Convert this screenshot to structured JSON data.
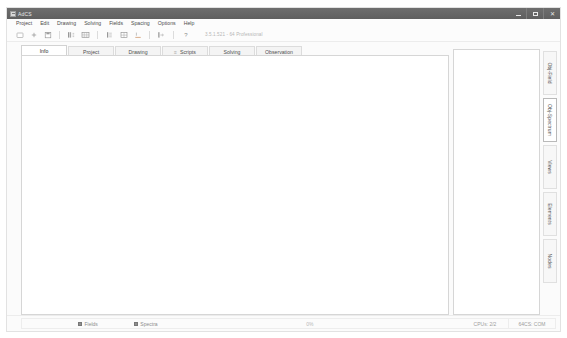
{
  "window": {
    "title": "AdCS",
    "app_icon": "window-app-icon",
    "controls": [
      {
        "name": "minimize",
        "glyph": "minimize-icon"
      },
      {
        "name": "maximize",
        "glyph": "maximize-icon"
      },
      {
        "name": "close",
        "glyph": "close-icon"
      }
    ]
  },
  "menubar": {
    "items": [
      {
        "label": "Project"
      },
      {
        "label": "Edit"
      },
      {
        "label": "Drawing"
      },
      {
        "label": "Solving"
      },
      {
        "label": "Fields"
      },
      {
        "label": "Spacing"
      },
      {
        "label": "Options"
      },
      {
        "label": "Help"
      }
    ]
  },
  "toolbar": {
    "buttons": [
      {
        "name": "new-document",
        "icon": "document-icon"
      },
      {
        "name": "add-item",
        "icon": "plus-icon"
      },
      {
        "name": "save",
        "icon": "save-icon"
      },
      {
        "name": "column-chart",
        "icon": "bar-chart-icon"
      },
      {
        "name": "grid-view",
        "icon": "grid-icon"
      },
      {
        "name": "rays",
        "icon": "rays-icon"
      },
      {
        "name": "table",
        "icon": "table-icon"
      },
      {
        "name": "underline-tool",
        "icon": "underline-icon"
      },
      {
        "name": "run-solve",
        "icon": "run-icon"
      },
      {
        "name": "help",
        "icon": "question-mark-icon"
      }
    ],
    "version": "3.5.1.521 - 64 Professional"
  },
  "tabs": {
    "items": [
      {
        "label": "Info",
        "active": true,
        "mark": ""
      },
      {
        "label": "Project",
        "active": false,
        "mark": ""
      },
      {
        "label": "Drawing",
        "active": false,
        "mark": ""
      },
      {
        "label": "Scripts",
        "active": false,
        "mark": "≡"
      },
      {
        "label": "Solving",
        "active": false,
        "mark": ""
      },
      {
        "label": "Observation",
        "active": false,
        "mark": ""
      }
    ]
  },
  "canvas": {
    "name": "main-drawing-canvas",
    "content": ""
  },
  "right_panel": {
    "content": "",
    "vtabs": [
      {
        "label": "Obj-Field",
        "active": false
      },
      {
        "label": "Obj-Spectrum",
        "active": true
      },
      {
        "label": "Views",
        "active": false
      },
      {
        "label": "Elements",
        "active": false
      },
      {
        "label": "Nodes",
        "active": false
      }
    ]
  },
  "statusbar": {
    "toggles": [
      {
        "label": "Fields",
        "checked": true
      },
      {
        "label": "Spectra",
        "checked": true
      }
    ],
    "progress_text": "0%",
    "cpu_text": "CPUs: 2/2",
    "mode_text": "64CS: COM"
  }
}
